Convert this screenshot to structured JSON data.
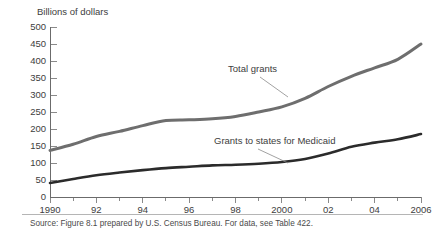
{
  "chart_data": {
    "type": "line",
    "title": "",
    "ylabel": "Billions of dollars",
    "xlabel": "",
    "ylim": [
      0,
      500
    ],
    "xlim": [
      1990,
      2006
    ],
    "ytick_step": 50,
    "grid": false,
    "legend_position": "inline-annotations",
    "yticks": [
      "0",
      "50",
      "100",
      "150",
      "200",
      "250",
      "300",
      "350",
      "400",
      "450",
      "500"
    ],
    "ytick_values": [
      0,
      50,
      100,
      150,
      200,
      250,
      300,
      350,
      400,
      450,
      500
    ],
    "xticks_major": [
      "1990",
      "92",
      "94",
      "96",
      "98",
      "2000",
      "02",
      "04",
      "2006"
    ],
    "xtick_values_major": [
      1990,
      1992,
      1994,
      1996,
      1998,
      2000,
      2002,
      2004,
      2006
    ],
    "xtick_values_all": [
      1990,
      1991,
      1992,
      1993,
      1994,
      1995,
      1996,
      1997,
      1998,
      1999,
      2000,
      2001,
      2002,
      2003,
      2004,
      2005,
      2006
    ],
    "x": [
      1990,
      1991,
      1992,
      1993,
      1994,
      1995,
      1996,
      1997,
      1998,
      1999,
      2000,
      2001,
      2002,
      2003,
      2004,
      2005,
      2006
    ],
    "series": [
      {
        "name": "Total grants",
        "color": "#6e6e6e",
        "width": 3.0,
        "values": [
          137,
          155,
          178,
          193,
          210,
          225,
          227,
          230,
          237,
          250,
          265,
          290,
          325,
          355,
          380,
          405,
          450
        ]
      },
      {
        "name": "Grants to states for Medicaid",
        "color": "#2b2b2b",
        "width": 2.6,
        "values": [
          41,
          53,
          64,
          72,
          79,
          85,
          89,
          93,
          95,
          98,
          103,
          112,
          128,
          148,
          160,
          170,
          185
        ]
      }
    ],
    "annotations": [
      {
        "text": "Total grants",
        "series": "Total grants",
        "label_x": 228,
        "label_y": 72,
        "leader": [
          [
            260,
            77
          ],
          [
            288,
            97
          ]
        ]
      },
      {
        "text": "Grants to states for Medicaid",
        "series": "Grants to states for Medicaid",
        "label_x": 214,
        "label_y": 144,
        "leader": [
          [
            258,
            149
          ],
          [
            288,
            163
          ]
        ]
      }
    ]
  },
  "source": {
    "text": "Source: Figure 8.1 prepared by U.S. Census Bureau.  For data, see Table 422."
  },
  "colors": {
    "axis": "#6b6b6b",
    "tick": "#8a8a8a",
    "text": "#3d3d3d",
    "total_grants": "#6e6e6e",
    "medicaid": "#2b2b2b",
    "background": "#ffffff",
    "rule": "#b5b5b5"
  }
}
